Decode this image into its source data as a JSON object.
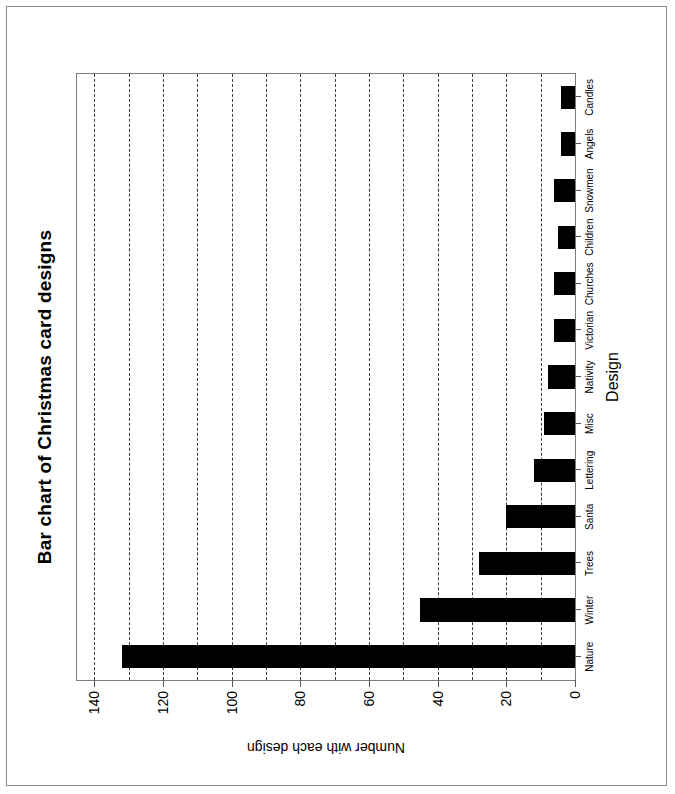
{
  "chart_data": {
    "type": "bar",
    "orientation": "horizontal",
    "title": "Bar chart of Christmas card designs",
    "xlabel": "Design",
    "ylabel": "Number with each design",
    "categories": [
      "Nature",
      "Winter",
      "Trees",
      "Santa",
      "Lettering",
      "Misc",
      "Nativity",
      "Victorian",
      "Churches",
      "Children",
      "Snowmen",
      "Angels",
      "Candles"
    ],
    "values": [
      132,
      45,
      28,
      20,
      12,
      9,
      8,
      6,
      6,
      5,
      6,
      4,
      4
    ],
    "ylim": [
      0,
      145
    ],
    "ytick_labels": [
      "0",
      "20",
      "40",
      "60",
      "80",
      "100",
      "120",
      "140"
    ],
    "ytick_values": [
      0,
      20,
      40,
      60,
      80,
      100,
      120,
      140
    ],
    "minor_tick_step": 10,
    "grid": true,
    "grid_style": "dashed",
    "grid_axis": "value",
    "legend": "none",
    "bar_color": "#000000",
    "plot_background": "#ffffff",
    "axis_color": "#555555"
  },
  "frame": {
    "border_color": "#8a8a8a"
  }
}
